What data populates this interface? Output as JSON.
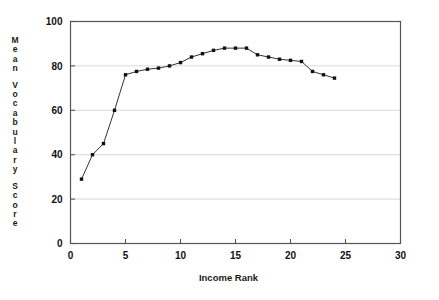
{
  "chart_data": {
    "type": "line",
    "title": "",
    "xlabel": "Income Rank",
    "ylabel": "Mean Vocabulary Score",
    "ylabel_chars": [
      "M",
      "e",
      "a",
      "n",
      "",
      "V",
      "o",
      "c",
      "a",
      "b",
      "u",
      "l",
      "a",
      "r",
      "y",
      "",
      "S",
      "c",
      "o",
      "r",
      "e"
    ],
    "xlim": [
      0,
      30
    ],
    "ylim": [
      0,
      100
    ],
    "xticks": [
      0,
      5,
      10,
      15,
      20,
      25,
      30
    ],
    "yticks": [
      0,
      20,
      40,
      60,
      80,
      100
    ],
    "xtick_labels": [
      "0",
      "5",
      "10",
      "15",
      "20",
      "25",
      "30"
    ],
    "ytick_labels": [
      "0",
      "20",
      "40",
      "60",
      "80",
      "100"
    ],
    "grid": "horizontal",
    "grid_color": "#c8c8c8",
    "legend": "none",
    "marker": "square",
    "marker_color": "#111111",
    "line_color": "#333333",
    "axis_color": "#555555",
    "x": [
      1,
      2,
      3,
      4,
      5,
      6,
      7,
      8,
      9,
      10,
      11,
      12,
      13,
      14,
      15,
      16,
      17,
      18,
      19,
      20,
      21,
      22,
      23,
      24
    ],
    "values": [
      29,
      40,
      45,
      60,
      76,
      77.5,
      78.5,
      79,
      80,
      81.5,
      84,
      85.5,
      87,
      88,
      88,
      88,
      85,
      84,
      83,
      82.5,
      82,
      77.5,
      76,
      74.5
    ],
    "series": [
      {
        "name": "Mean Vocabulary Score",
        "values": [
          29,
          40,
          45,
          60,
          76,
          77.5,
          78.5,
          79,
          80,
          81.5,
          84,
          85.5,
          87,
          88,
          88,
          88,
          85,
          84,
          83,
          82.5,
          82,
          77.5,
          76,
          74.5
        ]
      }
    ]
  }
}
